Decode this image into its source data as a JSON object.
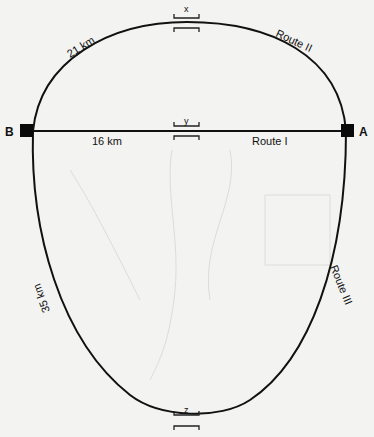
{
  "diagram": {
    "type": "route-network",
    "nodes": [
      {
        "id": "B",
        "label": "B",
        "x": 32,
        "y": 131
      },
      {
        "id": "A",
        "label": "A",
        "x": 347,
        "y": 131
      }
    ],
    "routes": [
      {
        "id": "route-1",
        "name": "Route I",
        "distance": "16 km",
        "shape": "straight"
      },
      {
        "id": "route-2",
        "name": "Route II",
        "distance": "21 km",
        "shape": "upper-arc"
      },
      {
        "id": "route-3",
        "name": "Route III",
        "distance": "35 km",
        "shape": "lower-loop"
      }
    ],
    "markers": [
      {
        "id": "x",
        "label": "x",
        "route": "Route II"
      },
      {
        "id": "y",
        "label": "y",
        "route": "Route I"
      },
      {
        "id": "z",
        "label": "z",
        "route": "Route III"
      }
    ],
    "colors": {
      "line": "#111111",
      "background": "#f3f3f1"
    }
  }
}
